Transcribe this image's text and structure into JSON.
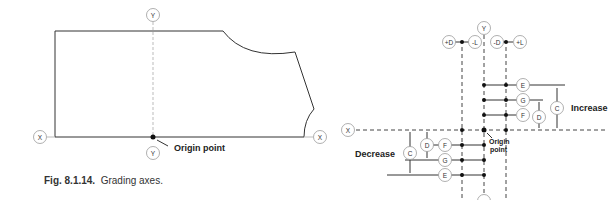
{
  "left_figure": {
    "axis_labels": {
      "x_left": "X",
      "x_right": "X",
      "y_top": "Y",
      "y_bottom": "Y"
    },
    "origin_label": "Origin point",
    "caption": {
      "number": "Fig. 8.1.14.",
      "text": "Grading axes."
    }
  },
  "right_figure": {
    "top_labels": {
      "plus_d": "+D",
      "minus_l": "-L",
      "y": "Y",
      "minus_d": "-D",
      "plus_l": "+L"
    },
    "x_label": "X",
    "origin_label_line1": "Origin",
    "origin_label_line2": "point",
    "increase_label": "Increase",
    "decrease_label": "Decrease",
    "upper_points": [
      "E",
      "G",
      "F"
    ],
    "upper_dims": [
      "D",
      "C"
    ],
    "lower_points": [
      "F",
      "G",
      "E"
    ],
    "lower_dims": [
      "D",
      "C"
    ]
  }
}
